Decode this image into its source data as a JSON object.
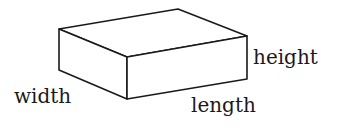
{
  "diagram": {
    "type": "rectangular-prism",
    "stroke_color": "#1a1a1a",
    "fill_color": "#ffffff",
    "vertices": {
      "top_back_left": [
        59,
        29
      ],
      "top_back_right": [
        178,
        9
      ],
      "top_front_right": [
        247,
        36
      ],
      "top_front_left": [
        127,
        57
      ],
      "bottom_back_left": [
        59,
        70
      ],
      "bottom_front_left": [
        127,
        99
      ],
      "bottom_front_right": [
        247,
        79
      ]
    },
    "labels": {
      "width": "width",
      "length": "length",
      "height": "height"
    }
  }
}
